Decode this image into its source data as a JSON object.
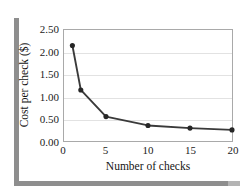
{
  "chart_data": {
    "type": "line",
    "title": "",
    "subtitle": "",
    "xlabel": "Number of checks",
    "ylabel": "Cost per check ($)",
    "x": [
      1,
      2,
      5,
      10,
      15,
      20
    ],
    "values": [
      2.15,
      1.15,
      0.55,
      0.35,
      0.29,
      0.25
    ],
    "series": [
      {
        "name": "Cost per check",
        "x": [
          1,
          2,
          5,
          10,
          15,
          20
        ],
        "values": [
          2.15,
          1.15,
          0.55,
          0.35,
          0.29,
          0.25
        ]
      }
    ],
    "xlim": [
      0,
      20
    ],
    "ylim": [
      0,
      2.5
    ],
    "xticks": [
      0,
      5,
      10,
      15,
      20
    ],
    "xtick_labels": [
      "0",
      "5",
      "10",
      "15",
      "20"
    ],
    "yticks": [
      0.0,
      0.5,
      1.0,
      1.5,
      2.0,
      2.5
    ],
    "ytick_labels": [
      "0.00",
      "0.50",
      "1.00",
      "1.50",
      "2.00",
      "2.50"
    ],
    "grid": "horizontal",
    "legend": "none",
    "marker": "filled-circle",
    "line_color": "#3a3a3a",
    "marker_color": "#262626",
    "grid_color": "#e2e2e2",
    "frame_color": "#a9a9a9",
    "shadow_color": "#8e8e8e",
    "annotations": []
  }
}
